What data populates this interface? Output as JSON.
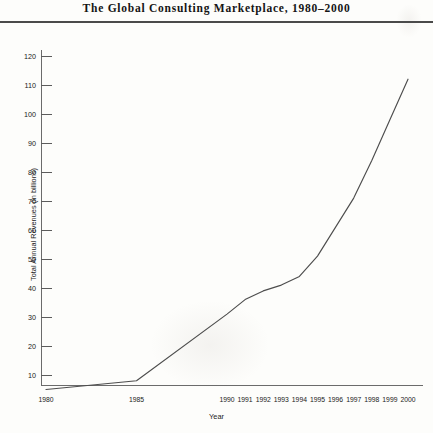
{
  "chart_data": {
    "type": "line",
    "title": "The Global Consulting Marketplace, 1980–2000",
    "xlabel": "Year",
    "ylabel": "Total Annual Revenues (in billions)",
    "categories": [
      "1980",
      "1985",
      "1990",
      "1991",
      "1992",
      "1993",
      "1994",
      "1995",
      "1996",
      "1997",
      "1998",
      "1999",
      "2000"
    ],
    "values": [
      5,
      8,
      31,
      36,
      39,
      41,
      44,
      51,
      61,
      71,
      84,
      98,
      112
    ],
    "series": [
      {
        "name": "Total Annual Revenues (in billions)",
        "values": [
          5,
          8,
          31,
          36,
          39,
          41,
          44,
          51,
          61,
          71,
          84,
          98,
          112
        ]
      }
    ],
    "yticks": [
      10,
      20,
      30,
      40,
      50,
      60,
      70,
      80,
      90,
      100,
      110,
      120
    ],
    "ytick_labels": [
      "10",
      "20",
      "30",
      "40",
      "50",
      "60",
      "70",
      "80",
      "90",
      "100",
      "110",
      "120"
    ],
    "ylim": [
      0,
      125
    ],
    "grid": false,
    "legend": "none",
    "line_color": "#4d4d4d"
  },
  "figure": {
    "title": "The Global Consulting Marketplace, 1980–2000",
    "axis_color": "#6b6b6b",
    "background": "#fdfdfb"
  }
}
